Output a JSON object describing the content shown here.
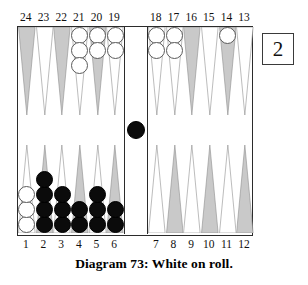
{
  "figure": {
    "caption": "Diagram 73:  White on roll.",
    "cube_value": "2",
    "colors": {
      "point_light": "#ffffff",
      "point_dark": "#c9c9c9",
      "point_outline": "#8a8a8a",
      "checker_white": "#ffffff",
      "checker_black": "#0b0b0b",
      "board_border": "#2b2b2b",
      "text": "#111111"
    }
  },
  "numbers": {
    "top_left": [
      "24",
      "23",
      "22",
      "21",
      "20",
      "19"
    ],
    "top_right": [
      "18",
      "17",
      "16",
      "15",
      "14",
      "13"
    ],
    "bottom_left": [
      "1",
      "2",
      "3",
      "4",
      "5",
      "6"
    ],
    "bottom_right": [
      "7",
      "8",
      "9",
      "10",
      "11",
      "12"
    ]
  },
  "board": {
    "bar": {
      "black": 1,
      "white": 0
    },
    "points": [
      {
        "n": "24",
        "quad": "tl",
        "idx": 0,
        "shade": "dark",
        "color": "",
        "count": 0
      },
      {
        "n": "23",
        "quad": "tl",
        "idx": 1,
        "shade": "light",
        "color": "",
        "count": 0
      },
      {
        "n": "22",
        "quad": "tl",
        "idx": 2,
        "shade": "dark",
        "color": "",
        "count": 0
      },
      {
        "n": "21",
        "quad": "tl",
        "idx": 3,
        "shade": "light",
        "color": "white",
        "count": 3
      },
      {
        "n": "20",
        "quad": "tl",
        "idx": 4,
        "shade": "dark",
        "color": "white",
        "count": 2
      },
      {
        "n": "19",
        "quad": "tl",
        "idx": 5,
        "shade": "light",
        "color": "white",
        "count": 2
      },
      {
        "n": "18",
        "quad": "tr",
        "idx": 0,
        "shade": "light",
        "color": "white",
        "count": 2
      },
      {
        "n": "17",
        "quad": "tr",
        "idx": 1,
        "shade": "light",
        "color": "white",
        "count": 2
      },
      {
        "n": "16",
        "quad": "tr",
        "idx": 2,
        "shade": "dark",
        "color": "",
        "count": 0
      },
      {
        "n": "15",
        "quad": "tr",
        "idx": 3,
        "shade": "light",
        "color": "",
        "count": 0
      },
      {
        "n": "14",
        "quad": "tr",
        "idx": 4,
        "shade": "dark",
        "color": "white",
        "count": 1
      },
      {
        "n": "13",
        "quad": "tr",
        "idx": 5,
        "shade": "light",
        "color": "",
        "count": 0
      },
      {
        "n": "1",
        "quad": "bl",
        "idx": 0,
        "shade": "light",
        "color": "white",
        "count": 3
      },
      {
        "n": "2",
        "quad": "bl",
        "idx": 1,
        "shade": "dark",
        "color": "black",
        "count": 4
      },
      {
        "n": "3",
        "quad": "bl",
        "idx": 2,
        "shade": "light",
        "color": "black",
        "count": 3
      },
      {
        "n": "4",
        "quad": "bl",
        "idx": 3,
        "shade": "dark",
        "color": "black",
        "count": 2
      },
      {
        "n": "5",
        "quad": "bl",
        "idx": 4,
        "shade": "light",
        "color": "black",
        "count": 3
      },
      {
        "n": "6",
        "quad": "bl",
        "idx": 5,
        "shade": "dark",
        "color": "black",
        "count": 2
      },
      {
        "n": "7",
        "quad": "br",
        "idx": 0,
        "shade": "light",
        "color": "",
        "count": 0
      },
      {
        "n": "8",
        "quad": "br",
        "idx": 1,
        "shade": "dark",
        "color": "",
        "count": 0
      },
      {
        "n": "9",
        "quad": "br",
        "idx": 2,
        "shade": "light",
        "color": "",
        "count": 0
      },
      {
        "n": "10",
        "quad": "br",
        "idx": 3,
        "shade": "dark",
        "color": "",
        "count": 0
      },
      {
        "n": "11",
        "quad": "br",
        "idx": 4,
        "shade": "light",
        "color": "",
        "count": 0
      },
      {
        "n": "12",
        "quad": "br",
        "idx": 5,
        "shade": "dark",
        "color": "",
        "count": 0
      }
    ]
  },
  "chart_data": {
    "type": "table",
    "title": "Diagram 73:  White on roll.",
    "xlabel": "Point number",
    "ylabel": "Checkers on point",
    "categories": [
      "24",
      "23",
      "22",
      "21",
      "20",
      "19",
      "18",
      "17",
      "16",
      "15",
      "14",
      "13",
      "1",
      "2",
      "3",
      "4",
      "5",
      "6",
      "7",
      "8",
      "9",
      "10",
      "11",
      "12",
      "bar"
    ],
    "series": [
      {
        "name": "White",
        "values": [
          0,
          0,
          0,
          3,
          2,
          2,
          2,
          2,
          0,
          0,
          1,
          0,
          3,
          0,
          0,
          0,
          0,
          0,
          0,
          0,
          0,
          0,
          0,
          0,
          0
        ]
      },
      {
        "name": "Black",
        "values": [
          0,
          0,
          0,
          0,
          0,
          0,
          0,
          0,
          0,
          0,
          0,
          0,
          0,
          4,
          3,
          2,
          3,
          2,
          0,
          0,
          0,
          0,
          0,
          0,
          1
        ]
      }
    ],
    "legend_position": "none",
    "grid": false
  }
}
